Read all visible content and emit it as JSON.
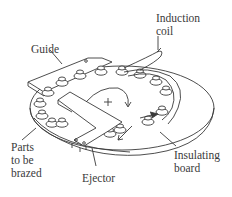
{
  "figure": {
    "type": "mechanical illustration",
    "labels": {
      "guide": "Guide",
      "induction_coil_line1": "Induction",
      "induction_coil_line2": "coil",
      "parts_line1": "Parts",
      "parts_line2": "to be",
      "parts_line3": "brazed",
      "ejector": "Ejector",
      "insulating_line1": "Insulating",
      "insulating_line2": "board"
    },
    "rotation_symbol": "+",
    "colors": {
      "line": "#3a3a3a",
      "background": "#ffffff"
    }
  }
}
